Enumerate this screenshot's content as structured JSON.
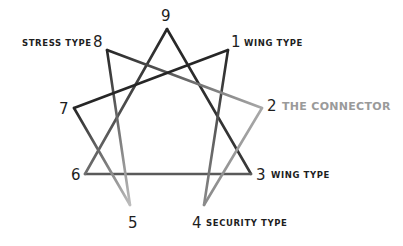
{
  "diagram": {
    "type": "enneagram",
    "points": [
      {
        "n": "9",
        "x": 167,
        "y": 29,
        "label": ""
      },
      {
        "n": "1",
        "x": 228,
        "y": 50,
        "label": "WING TYPE"
      },
      {
        "n": "2",
        "x": 262,
        "y": 108,
        "label": "THE CONNECTOR",
        "highlight": true
      },
      {
        "n": "3",
        "x": 251,
        "y": 174,
        "label": "WING TYPE"
      },
      {
        "n": "4",
        "x": 204,
        "y": 205,
        "label": "SECURITY TYPE"
      },
      {
        "n": "5",
        "x": 130,
        "y": 205,
        "label": ""
      },
      {
        "n": "6",
        "x": 85,
        "y": 174,
        "label": ""
      },
      {
        "n": "7",
        "x": 74,
        "y": 108,
        "label": ""
      },
      {
        "n": "8",
        "x": 107,
        "y": 50,
        "label": "STRESS TYPE"
      }
    ],
    "triangle": [
      "9",
      "3",
      "6"
    ],
    "hexad": [
      "1",
      "4",
      "2",
      "8",
      "5",
      "7"
    ],
    "colors": {
      "dark": "#262626",
      "light": "#a8a8a8",
      "text": "#1e1e1e",
      "highlight": "#9a9a9a"
    }
  },
  "labels": {
    "n9": "9",
    "n8": "8",
    "n1": "1",
    "n7": "7",
    "n2": "2",
    "n6": "6",
    "n3": "3",
    "n5": "5",
    "n4": "4",
    "stress": "STRESS TYPE",
    "wing1": "WING TYPE",
    "connector": "THE CONNECTOR",
    "wing3": "WING TYPE",
    "security": "SECURITY TYPE"
  }
}
